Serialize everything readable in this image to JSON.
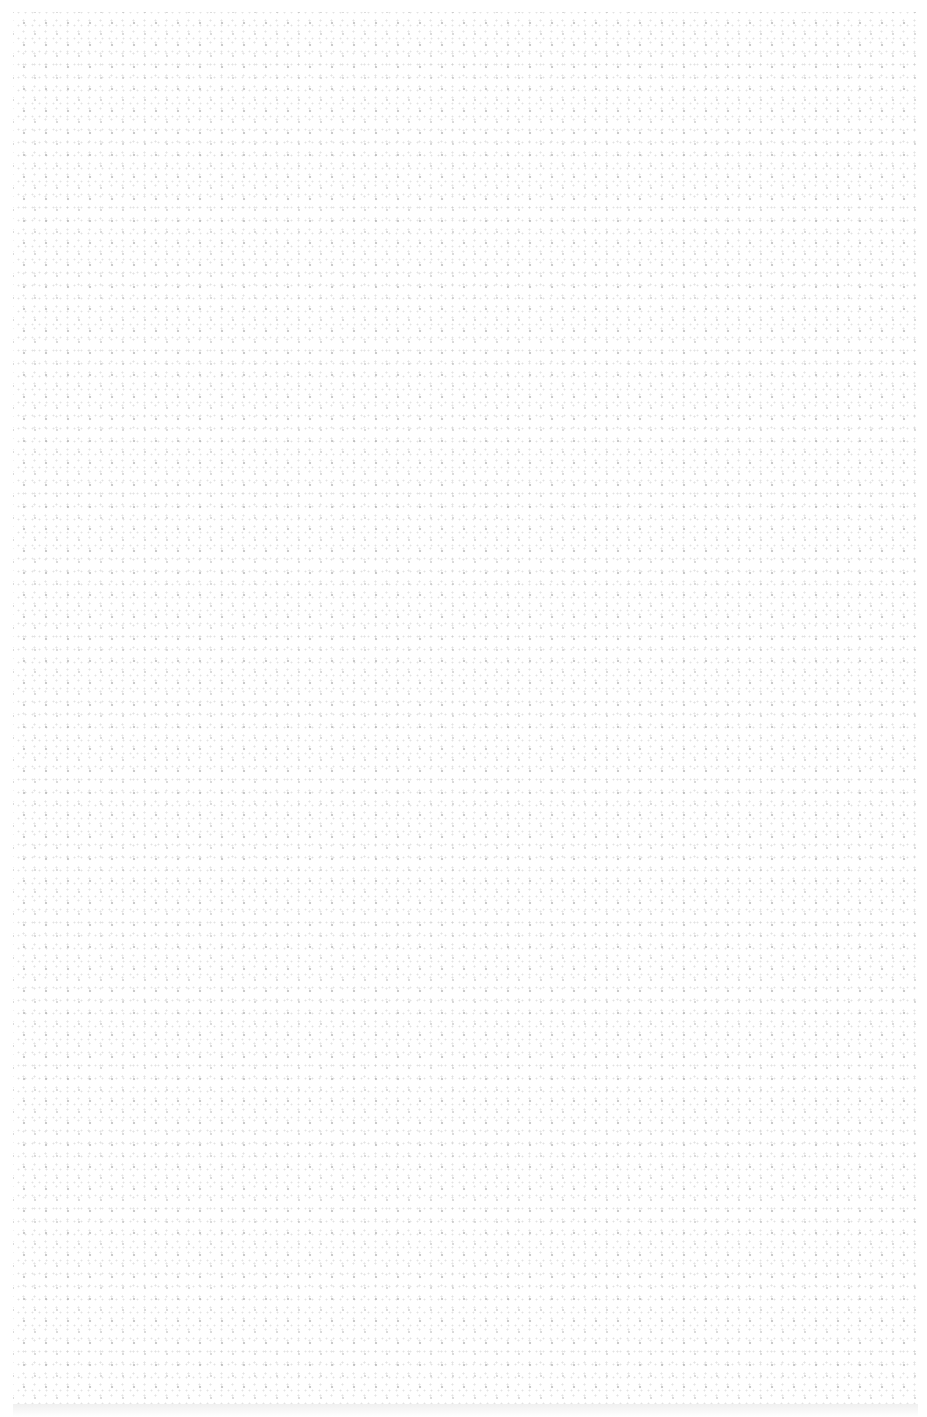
{
  "canvas": {
    "width": 927,
    "height": 1417,
    "background_color": "#ffffff"
  },
  "panel": {
    "pattern": "dotted-texture",
    "dot_color": "#a8a8a8",
    "text_content": ""
  }
}
